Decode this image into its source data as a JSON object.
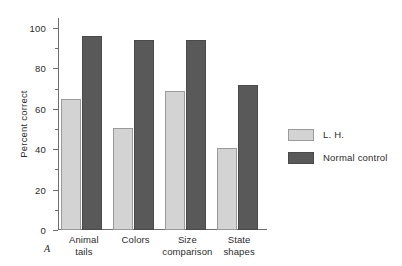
{
  "panel": {
    "label": "A"
  },
  "legend": {
    "position": "right",
    "entries": [
      {
        "label": "L. H.",
        "color": "#d3d3d3"
      },
      {
        "label": "Normal control",
        "color": "#595959"
      }
    ]
  },
  "axis": {
    "y_title": "Percent correct",
    "y_ticks": [
      "100",
      "80",
      "60",
      "40",
      "20",
      "0"
    ],
    "y_minor_ticks": [
      90,
      70,
      50,
      30,
      10
    ]
  },
  "chart_data": {
    "type": "bar",
    "title": "",
    "xlabel": "",
    "ylabel": "Percent correct",
    "ylim": [
      0,
      105
    ],
    "grid": false,
    "legend_position": "right",
    "categories": [
      "Animal tails",
      "Colors",
      "Size comparison",
      "State shapes"
    ],
    "category_lines": [
      [
        "Animal",
        "tails"
      ],
      [
        "Colors",
        ""
      ],
      [
        "Size",
        "comparison"
      ],
      [
        "State",
        "shapes"
      ]
    ],
    "series": [
      {
        "name": "L. H.",
        "color": "#d3d3d3",
        "values": [
          65,
          50.5,
          69,
          40.5
        ]
      },
      {
        "name": "Normal control",
        "color": "#595959",
        "values": [
          96,
          94,
          94,
          72
        ]
      }
    ]
  }
}
